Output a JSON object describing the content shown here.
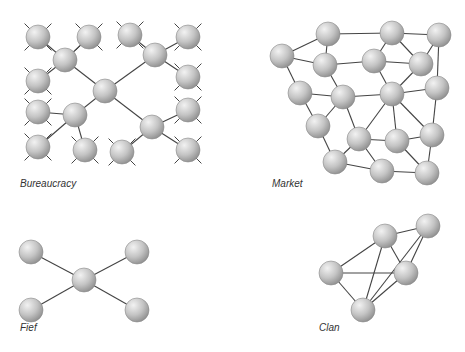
{
  "style": {
    "edge_color": "#444444",
    "node_fill_light": "#f2f2f2",
    "node_fill_mid": "#c4c4c4",
    "node_fill_dark": "#8e8e8e",
    "node_stroke": "#8a8a8a",
    "node_radius": 12
  },
  "panels": [
    {
      "id": "bureaucracy",
      "label": "Bureaucracy",
      "label_pos": [
        20,
        188
      ],
      "nodes": [
        [
          105,
          91
        ],
        [
          65,
          60
        ],
        [
          155,
          55
        ],
        [
          75,
          115
        ],
        [
          152,
          127
        ],
        [
          38,
          37
        ],
        [
          89,
          37
        ],
        [
          130,
          35
        ],
        [
          188,
          37
        ],
        [
          38,
          81
        ],
        [
          188,
          77
        ],
        [
          38,
          112
        ],
        [
          188,
          110
        ],
        [
          38,
          147
        ],
        [
          85,
          150
        ],
        [
          122,
          152
        ],
        [
          188,
          150
        ]
      ],
      "edges": [
        [
          0,
          1
        ],
        [
          0,
          2
        ],
        [
          0,
          3
        ],
        [
          0,
          4
        ],
        [
          1,
          5
        ],
        [
          1,
          6
        ],
        [
          1,
          9
        ],
        [
          2,
          7
        ],
        [
          2,
          8
        ],
        [
          2,
          10
        ],
        [
          3,
          11
        ],
        [
          3,
          13
        ],
        [
          3,
          14
        ],
        [
          4,
          12
        ],
        [
          4,
          15
        ],
        [
          4,
          16
        ]
      ],
      "stubs": true
    },
    {
      "id": "market",
      "label": "Market",
      "label_pos": [
        272,
        188
      ],
      "nodes": [
        [
          328,
          34
        ],
        [
          392,
          33
        ],
        [
          439,
          35
        ],
        [
          282,
          56
        ],
        [
          325,
          65
        ],
        [
          374,
          61
        ],
        [
          421,
          64
        ],
        [
          300,
          93
        ],
        [
          343,
          97
        ],
        [
          392,
          94
        ],
        [
          437,
          88
        ],
        [
          318,
          126
        ],
        [
          359,
          139
        ],
        [
          397,
          141
        ],
        [
          432,
          135
        ],
        [
          335,
          162
        ],
        [
          382,
          171
        ],
        [
          427,
          173
        ]
      ],
      "edges": [
        [
          0,
          1
        ],
        [
          1,
          2
        ],
        [
          0,
          3
        ],
        [
          0,
          4
        ],
        [
          3,
          4
        ],
        [
          4,
          5
        ],
        [
          5,
          6
        ],
        [
          1,
          5
        ],
        [
          1,
          6
        ],
        [
          2,
          6
        ],
        [
          2,
          10
        ],
        [
          3,
          7
        ],
        [
          4,
          8
        ],
        [
          7,
          8
        ],
        [
          5,
          9
        ],
        [
          6,
          9
        ],
        [
          8,
          9
        ],
        [
          9,
          10
        ],
        [
          7,
          11
        ],
        [
          8,
          11
        ],
        [
          8,
          12
        ],
        [
          9,
          12
        ],
        [
          9,
          13
        ],
        [
          9,
          14
        ],
        [
          10,
          14
        ],
        [
          11,
          15
        ],
        [
          12,
          13
        ],
        [
          13,
          14
        ],
        [
          12,
          15
        ],
        [
          12,
          16
        ],
        [
          15,
          16
        ],
        [
          16,
          17
        ],
        [
          13,
          17
        ],
        [
          14,
          17
        ]
      ],
      "stubs": false
    },
    {
      "id": "fief",
      "label": "Fief",
      "label_pos": [
        20,
        332
      ],
      "nodes": [
        [
          84,
          280
        ],
        [
          31,
          252
        ],
        [
          137,
          252
        ],
        [
          31,
          310
        ],
        [
          137,
          310
        ]
      ],
      "edges": [
        [
          0,
          1
        ],
        [
          0,
          2
        ],
        [
          0,
          3
        ],
        [
          0,
          4
        ]
      ],
      "stubs": false
    },
    {
      "id": "clan",
      "label": "Clan",
      "label_pos": [
        319,
        332
      ],
      "nodes": [
        [
          385,
          236
        ],
        [
          428,
          226
        ],
        [
          331,
          273
        ],
        [
          406,
          273
        ],
        [
          363,
          310
        ]
      ],
      "edges": [
        [
          0,
          1
        ],
        [
          0,
          2
        ],
        [
          0,
          3
        ],
        [
          0,
          4
        ],
        [
          1,
          3
        ],
        [
          1,
          4
        ],
        [
          2,
          3
        ],
        [
          2,
          4
        ],
        [
          3,
          4
        ]
      ],
      "stubs": false
    }
  ]
}
